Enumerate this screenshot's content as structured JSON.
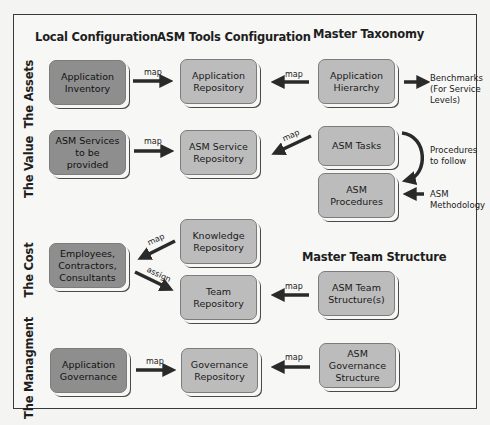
{
  "columns": {
    "local": "Local Configuration",
    "tools": "ASM Tools Configuration",
    "master": "Master Taxonomy",
    "team_master": "Master Team Structure"
  },
  "rows": {
    "assets": "The Assets",
    "value": "The Value",
    "cost": "The Cost",
    "management": "The Managment"
  },
  "boxes": {
    "app_inventory": "Application Inventory",
    "app_repository": "Application Repository",
    "app_hierarchy": "Application Hierarchy",
    "asm_services": "ASM Services to be provided",
    "asm_service_repo": "ASM Service Repository",
    "asm_tasks": "ASM Tasks",
    "asm_procedures": "ASM Procedures",
    "employees": "Employees, Contractors, Consultants",
    "knowledge_repo": "Knowledge Repository",
    "team_repo": "Team Repository",
    "asm_team_structure": "ASM Team Structure(s)",
    "app_governance": "Application Governance",
    "governance_repo": "Governance Repository",
    "asm_governance_structure": "ASM Governance Structure"
  },
  "arrow_labels": {
    "map": "map",
    "assign": "assign"
  },
  "side_notes": {
    "benchmarks_1": "Benchmarks",
    "benchmarks_2": "(For Service",
    "benchmarks_3": "Levels)",
    "procedures_1": "Procedures",
    "procedures_2": "to follow",
    "methodology_1": "ASM",
    "methodology_2": "Methodology"
  },
  "colors": {
    "local_box": "#8e8e8e",
    "tool_box": "#bcbcbc",
    "arrow": "#2a2a2a",
    "frame": "#3a3a3a"
  }
}
